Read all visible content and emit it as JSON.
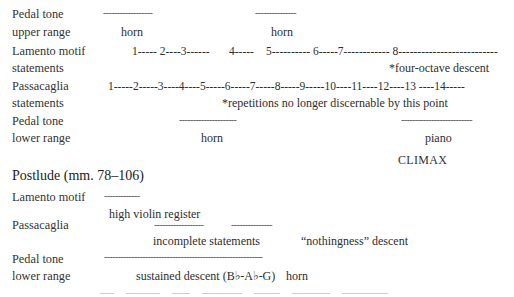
{
  "section1": {
    "pedal_upper": {
      "label_line1": "Pedal tone",
      "label_line2": "upper range",
      "dashes_a": "------------------",
      "dashes_b": "---------------",
      "note_a": "horn",
      "note_b": "horn"
    },
    "lamento": {
      "label_line1": "Lamento motif",
      "label_line2": "statements",
      "seq_a": "1----- 2----3------",
      "seq_b": "4-----",
      "seq_c": "5---------- 6-----7------------ 8--------------------------",
      "note": "*four-octave descent"
    },
    "passacaglia": {
      "label_line1": "Passacaglia",
      "label_line2": "statements",
      "seq": "1-----2-----3----4----5-----6-----7-----8-----9-----10----11----12----13 ----14-----",
      "note": "*repetitions no longer discernable by this point"
    },
    "pedal_lower": {
      "label_line1": "Pedal tone",
      "label_line2": "lower range",
      "dashes_a": "---------------------",
      "dashes_b": "--------------------------",
      "note_a": "horn",
      "note_b": "piano"
    },
    "climax": "CLIMAX"
  },
  "postlude": {
    "heading": "Postlude (mm. 78–106)",
    "lamento": {
      "label": "Lamento motif",
      "dashes": "-------------",
      "note": "high violin register"
    },
    "passacaglia": {
      "label": "Passacaglia",
      "dashes_a": "------------------",
      "dashes_b": "---------------",
      "note_a": "incomplete statements",
      "note_b": "“nothingness” descent"
    },
    "pedal": {
      "label_line1": "Pedal tone",
      "label_line2": "lower range",
      "dashes": "----------------------------------------------------------",
      "note_a": "sustained descent (B♭-A♭-G)",
      "note_b": "horn"
    }
  }
}
